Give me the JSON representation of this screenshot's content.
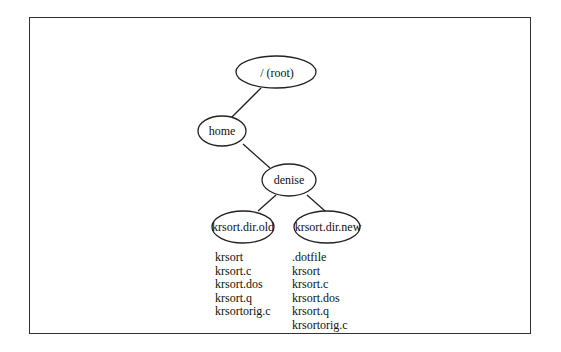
{
  "diagram": {
    "nodes": {
      "root": {
        "label": "/ (root)"
      },
      "home": {
        "label": "home"
      },
      "denise": {
        "label": "denise"
      },
      "old": {
        "label": "krsort.dir.old"
      },
      "new": {
        "label": "krsort.dir.new"
      }
    },
    "edges": [
      [
        "root",
        "home"
      ],
      [
        "home",
        "denise"
      ],
      [
        "denise",
        "old"
      ],
      [
        "denise",
        "new"
      ]
    ],
    "files_old": [
      "krsort",
      "krsort.c",
      "krsort.dos",
      "krsort.q",
      "krsortorig.c"
    ],
    "files_new": [
      ".dotfile",
      "krsort",
      "krsort.c",
      "krsort.dos",
      "krsort.q",
      "krsortorig.c"
    ]
  }
}
